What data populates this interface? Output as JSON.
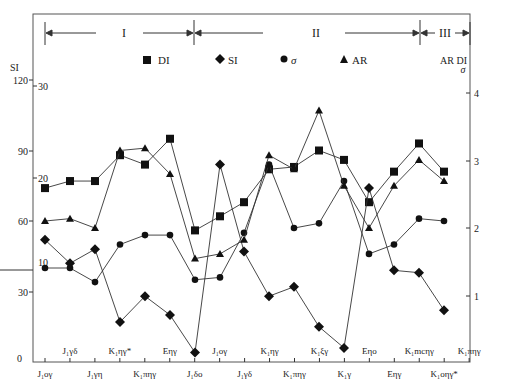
{
  "chart_data": {
    "type": "line",
    "title": "",
    "phases": [
      {
        "label": "I",
        "x_start": 45,
        "x_end": 195
      },
      {
        "label": "II",
        "x_start": 195,
        "x_end": 420
      },
      {
        "label": "III",
        "x_start": 420,
        "x_end": 470
      }
    ],
    "categories": [
      "J1oγ",
      "J1γδ",
      "J1γη",
      "K1ηγ*",
      "K1πηγ",
      "Eηγ",
      "J1δo",
      "J1oγ",
      "J1γδ",
      "K1ηγ",
      "K1πηγ",
      "K1ξγ",
      "K1γ",
      "Eηo",
      "Eηγ",
      "K1mcηγ",
      "K1oηγ*",
      "K1πηγ"
    ],
    "x_labels_bottom": [
      "J₁oγ",
      "J₁γη",
      "K₁πηγ",
      "J₁δo",
      "J₁γδ",
      "K₁πηγ",
      "K₁γ",
      "Eηγ",
      "K₁oηγ*"
    ],
    "x_labels_top": [
      "J₁γδ",
      "K₁ηγ*",
      "Eηγ",
      "J₁oγ",
      "K₁ηγ",
      "K₁ξγ",
      "Eηo",
      "K₁mcηγ",
      "K₁πηγ"
    ],
    "axes": {
      "left_outer": {
        "label": "SI",
        "ticks": [
          0,
          30,
          60,
          90,
          120
        ],
        "range": [
          0,
          120
        ]
      },
      "left_inner": {
        "label": "DI",
        "ticks": [
          10,
          20,
          30
        ],
        "range": [
          0,
          30
        ]
      },
      "right": {
        "label": "AR DI σ",
        "ticks": [
          1,
          2,
          3,
          4
        ],
        "range": [
          0,
          4
        ]
      }
    },
    "legend": [
      {
        "name": "DI",
        "marker": "square"
      },
      {
        "name": "SI",
        "marker": "diamond"
      },
      {
        "name": "σ",
        "marker": "circle"
      },
      {
        "name": "AR",
        "marker": "triangle"
      }
    ],
    "series": [
      {
        "name": "DI",
        "marker": "square",
        "points": [
          [
            45,
            74
          ],
          [
            70,
            77
          ],
          [
            95,
            77
          ],
          [
            120,
            88
          ],
          [
            145,
            84
          ],
          [
            170,
            95
          ],
          [
            195,
            56
          ],
          [
            220,
            62
          ],
          [
            244,
            68
          ],
          [
            269,
            82
          ],
          [
            294,
            83
          ],
          [
            319,
            90
          ],
          [
            344,
            86
          ],
          [
            369,
            68
          ],
          [
            394,
            81
          ],
          [
            419,
            93
          ],
          [
            444,
            81
          ],
          [
            469,
            81
          ]
        ]
      },
      {
        "name": "SI",
        "marker": "diamond",
        "points": [
          [
            45,
            52
          ],
          [
            70,
            42
          ],
          [
            95,
            48
          ],
          [
            120,
            17
          ],
          [
            145,
            28
          ],
          [
            170,
            20
          ],
          [
            195,
            4
          ],
          [
            220,
            84
          ],
          [
            244,
            47
          ],
          [
            269,
            28
          ],
          [
            294,
            32
          ],
          [
            319,
            15
          ],
          [
            344,
            6
          ],
          [
            369,
            74
          ],
          [
            394,
            39
          ],
          [
            419,
            38
          ],
          [
            444,
            22
          ],
          [
            469,
            22
          ]
        ]
      },
      {
        "name": "σ",
        "marker": "circle",
        "points": [
          [
            45,
            40
          ],
          [
            70,
            40
          ],
          [
            95,
            34
          ],
          [
            120,
            50
          ],
          [
            145,
            54
          ],
          [
            170,
            54
          ],
          [
            195,
            35
          ],
          [
            220,
            36
          ],
          [
            244,
            55
          ],
          [
            269,
            84
          ],
          [
            294,
            57
          ],
          [
            319,
            59
          ],
          [
            344,
            77
          ],
          [
            369,
            46
          ],
          [
            394,
            50
          ],
          [
            419,
            61
          ],
          [
            444,
            60
          ],
          [
            469,
            46
          ]
        ]
      },
      {
        "name": "AR",
        "marker": "triangle",
        "points": [
          [
            45,
            60
          ],
          [
            70,
            61
          ],
          [
            95,
            57
          ],
          [
            120,
            90
          ],
          [
            145,
            91
          ],
          [
            170,
            80
          ],
          [
            195,
            44
          ],
          [
            220,
            46
          ],
          [
            244,
            52
          ],
          [
            269,
            88
          ],
          [
            294,
            82
          ],
          [
            319,
            107
          ],
          [
            344,
            75
          ],
          [
            369,
            57
          ],
          [
            394,
            75
          ],
          [
            419,
            86
          ],
          [
            444,
            77
          ],
          [
            469,
            71
          ]
        ]
      }
    ]
  },
  "labels": {
    "phase_I": "I",
    "phase_II": "II",
    "phase_III": "III",
    "left_axis_title": "SI",
    "right_axis_title_top": "AR DI",
    "right_axis_title_bottom": "σ",
    "legend_di": "DI",
    "legend_si": "SI",
    "legend_sigma": "σ",
    "legend_ar": "AR",
    "si_ticks": [
      "0",
      "30",
      "60",
      "90",
      "120"
    ],
    "di_ticks": [
      "10",
      "20",
      "30"
    ],
    "right_ticks": [
      "1",
      "2",
      "3",
      "4"
    ]
  }
}
